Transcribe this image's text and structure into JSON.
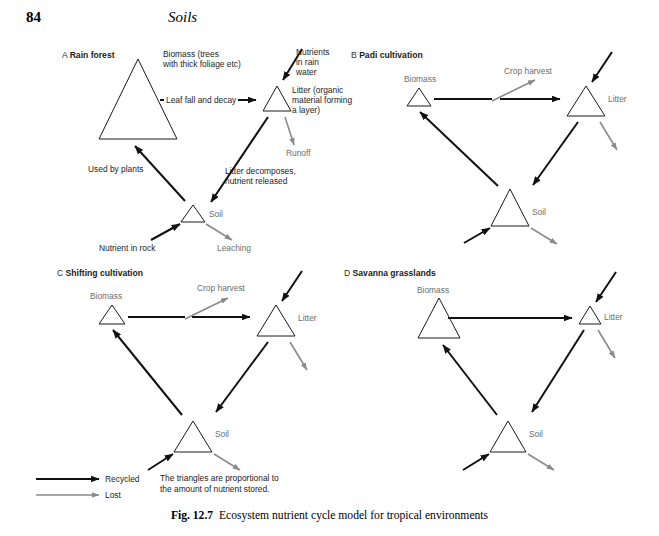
{
  "page": {
    "number": "84",
    "running_head": "Soils"
  },
  "figure": {
    "caption_label": "Fig. 12.7",
    "caption_text": "Ecosystem nutrient cycle model for tropical environments"
  },
  "colors": {
    "recycled_arrow": "#111111",
    "lost_arrow": "#8a8a8a",
    "triangle_stroke": "#1a1a1a",
    "label_dark": "#1c1c1c",
    "label_grey": "#6e6e6e",
    "background": "#ffffff"
  },
  "legend": {
    "items": [
      {
        "label": "Recycled",
        "style": "thick-black-arrow"
      },
      {
        "label": "Lost",
        "style": "thin-grey-arrow"
      }
    ],
    "note_line1": "The triangles are proportional to",
    "note_line2": "the amount of nutrient stored."
  },
  "panels": [
    {
      "id": "A",
      "letter": "A",
      "title": "Rain forest",
      "nodes": [
        {
          "name": "biomass",
          "label_line1": "Biomass (trees",
          "label_line2": "with thick foliage etc)",
          "size": "large"
        },
        {
          "name": "litter",
          "label_line1": "Litter (organic",
          "label_line2": "material forming",
          "label_line3": "a layer)",
          "size": "medium"
        },
        {
          "name": "soil",
          "label_line1": "Soil",
          "size": "small"
        }
      ],
      "flows": [
        {
          "name": "leaf-fall",
          "label": "Leaf fall and decay",
          "type": "recycled"
        },
        {
          "name": "nutrients-in-rain-water",
          "label_line1": "Nutrients",
          "label_line2": "in rain",
          "label_line3": "water",
          "type": "recycled"
        },
        {
          "name": "runoff",
          "label": "Runoff",
          "type": "lost"
        },
        {
          "name": "litter-decomposes",
          "label_line1": "Litter decomposes,",
          "label_line2": "nutrient released",
          "type": "recycled"
        },
        {
          "name": "used-by-plants",
          "label": "Used by plants",
          "type": "recycled"
        },
        {
          "name": "nutrient-in-rock",
          "label": "Nutrient in rock",
          "type": "recycled"
        },
        {
          "name": "leaching",
          "label": "Leaching",
          "type": "lost"
        }
      ]
    },
    {
      "id": "B",
      "letter": "B",
      "title": "Padi cultivation",
      "nodes": [
        {
          "name": "biomass",
          "label_line1": "Biomass",
          "size": "small"
        },
        {
          "name": "litter",
          "label_line1": "Litter",
          "size": "medium"
        },
        {
          "name": "soil",
          "label_line1": "Soil",
          "size": "large"
        }
      ],
      "flows": [
        {
          "name": "crop-harvest",
          "label": "Crop harvest",
          "type": "lost"
        },
        {
          "name": "biomass-to-litter",
          "label": "",
          "type": "recycled"
        },
        {
          "name": "input-to-litter",
          "label": "",
          "type": "recycled"
        },
        {
          "name": "litter-loss",
          "label": "",
          "type": "lost"
        },
        {
          "name": "litter-to-soil",
          "label": "",
          "type": "recycled"
        },
        {
          "name": "soil-to-biomass",
          "label": "",
          "type": "recycled"
        },
        {
          "name": "input-to-soil",
          "label": "",
          "type": "recycled"
        },
        {
          "name": "soil-loss",
          "label": "",
          "type": "lost"
        }
      ]
    },
    {
      "id": "C",
      "letter": "C",
      "title": "Shifting cultivation",
      "nodes": [
        {
          "name": "biomass",
          "label_line1": "Biomass",
          "size": "small"
        },
        {
          "name": "litter",
          "label_line1": "Litter",
          "size": "medium"
        },
        {
          "name": "soil",
          "label_line1": "Soil",
          "size": "medium"
        }
      ],
      "flows": [
        {
          "name": "crop-harvest",
          "label": "Crop harvest",
          "type": "lost"
        },
        {
          "name": "biomass-to-litter",
          "label": "",
          "type": "recycled"
        },
        {
          "name": "input-to-litter",
          "label": "",
          "type": "recycled"
        },
        {
          "name": "litter-loss",
          "label": "",
          "type": "lost"
        },
        {
          "name": "litter-to-soil",
          "label": "",
          "type": "recycled"
        },
        {
          "name": "soil-to-biomass",
          "label": "",
          "type": "recycled"
        },
        {
          "name": "input-to-soil",
          "label": "",
          "type": "recycled"
        },
        {
          "name": "soil-loss",
          "label": "",
          "type": "lost"
        }
      ]
    },
    {
      "id": "D",
      "letter": "D",
      "title": "Savanna grasslands",
      "nodes": [
        {
          "name": "biomass",
          "label_line1": "Biomass",
          "size": "large"
        },
        {
          "name": "litter",
          "label_line1": "Litter",
          "size": "small"
        },
        {
          "name": "soil",
          "label_line1": "Soil",
          "size": "medium"
        }
      ],
      "flows": [
        {
          "name": "biomass-to-litter",
          "label": "",
          "type": "recycled"
        },
        {
          "name": "input-to-litter",
          "label": "",
          "type": "recycled"
        },
        {
          "name": "litter-loss",
          "label": "",
          "type": "lost"
        },
        {
          "name": "litter-to-soil",
          "label": "",
          "type": "recycled"
        },
        {
          "name": "soil-to-biomass",
          "label": "",
          "type": "recycled"
        },
        {
          "name": "input-to-soil",
          "label": "",
          "type": "recycled"
        },
        {
          "name": "soil-loss",
          "label": "",
          "type": "lost"
        }
      ]
    }
  ]
}
